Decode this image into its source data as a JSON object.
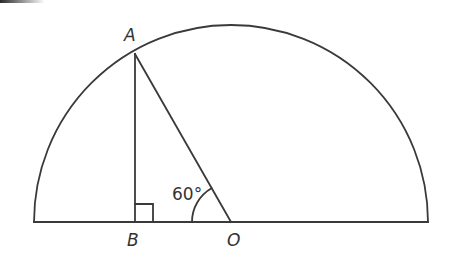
{
  "diagram": {
    "type": "geometry",
    "points": {
      "A": {
        "label": "A"
      },
      "B": {
        "label": "B"
      },
      "O": {
        "label": "O"
      }
    },
    "angle_label": "60°",
    "right_angle_at": "B",
    "stroke_color": "#3a3a3a",
    "background_color": "#ffffff"
  }
}
